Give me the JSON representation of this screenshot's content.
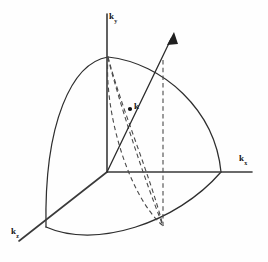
{
  "figure": {
    "background_color": "#fefefe",
    "line_color": "#2e2e2e",
    "dash_color": "#4a4a4a",
    "width": 268,
    "height": 262
  },
  "axes": {
    "vertical": {
      "label_base": "k",
      "label_sub": "y",
      "name": "k-y-axis",
      "from": [
        107,
        14
      ],
      "to": [
        107,
        172
      ]
    },
    "horizontal": {
      "label_base": "k",
      "label_sub": "x",
      "name": "k-x-axis",
      "from": [
        107,
        172
      ],
      "to": [
        252,
        172
      ]
    },
    "depth": {
      "label_base": "k",
      "label_sub": "z",
      "name": "k-z-axis",
      "from": [
        107,
        172
      ],
      "to": [
        19,
        241
      ]
    },
    "origin": [
      107,
      172
    ]
  },
  "vector": {
    "label": "k",
    "name": "wave-vector-k",
    "from": [
      107,
      172
    ],
    "to": [
      174,
      33
    ],
    "point_on_sphere": [
      137,
      109
    ]
  },
  "sphere_octant": {
    "radius_px": 114,
    "apex_y": [
      108,
      57
    ],
    "intercept_x": [
      221,
      172
    ],
    "intercept_z": [
      46,
      227
    ]
  },
  "construction_lines": [
    {
      "name": "meridian-dashed-arc",
      "from": [
        108,
        57
      ],
      "to": [
        163,
        225
      ]
    },
    {
      "name": "projection-dashed-arc",
      "from": [
        108,
        57
      ],
      "to": [
        163,
        225
      ]
    },
    {
      "name": "drop-dashed-line",
      "from": [
        163,
        172
      ],
      "to": [
        163,
        226
      ]
    }
  ]
}
